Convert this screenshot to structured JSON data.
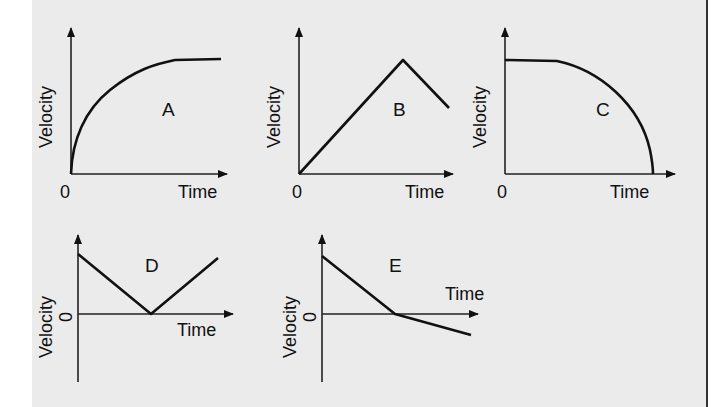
{
  "figure": {
    "axis_labels": {
      "y": "Velocity",
      "x": "Time",
      "origin": "0"
    },
    "graphs": [
      {
        "id": "A",
        "label": "A",
        "shape": "increasing curve that rises steeply from 0 then levels off to constant velocity"
      },
      {
        "id": "B",
        "label": "B",
        "shape": "linear increase from 0 to a peak, then linear decrease"
      },
      {
        "id": "C",
        "label": "C",
        "shape": "constant velocity then curving downward, decreasing to 0 at an increasing rate"
      },
      {
        "id": "D",
        "label": "D",
        "shape": "linear decrease from positive value to 0, then linear increase"
      },
      {
        "id": "E",
        "label": "E",
        "shape": "linear decrease from positive value through 0 into negative values, with shallower slope after crossing"
      }
    ]
  },
  "colors": {
    "panel_background": "#ebebeb",
    "line": "#111111",
    "page_background": "#ffffff"
  }
}
